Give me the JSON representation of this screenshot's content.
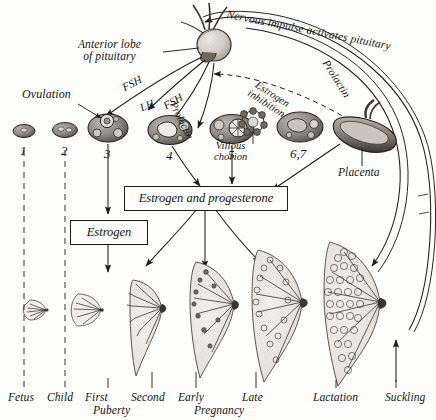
{
  "figure": {
    "background_color": "#fdfdfc",
    "ink_color": "#1b1b1b"
  },
  "organ_labels": {
    "pituitary": "Anterior lobe\nof pituitary",
    "pituitary_line1": "Anterior lobe",
    "pituitary_line2": "of pituitary",
    "ovulation": "Ovulation",
    "villous_chorion_line1": "Villous",
    "villous_chorion_line2": "chorion",
    "placenta": "Placenta"
  },
  "hormone_arrows": [
    {
      "label": "FSH"
    },
    {
      "label": "LH"
    },
    {
      "label": "FSH"
    },
    {
      "label": "Prolactin"
    }
  ],
  "arc_labels": {
    "nervous_impulse": "Nervous impulse activates pituitary",
    "prolactin": "Prolactin",
    "estrogen_inhibition_line1": "Estrogen",
    "estrogen_inhibition_line2": "inhibition"
  },
  "boxes": [
    {
      "id": "estrogen-progesterone",
      "label": "Estrogen and progesterone"
    },
    {
      "id": "estrogen",
      "label": "Estrogen"
    }
  ],
  "ovary_stages": [
    {
      "number": "1"
    },
    {
      "number": "2"
    },
    {
      "number": "3"
    },
    {
      "number": "4"
    },
    {
      "number": "5"
    },
    {
      "number": "6,7"
    }
  ],
  "stage_labels": [
    {
      "label": "Fetus"
    },
    {
      "label": "Child"
    },
    {
      "label": "First"
    },
    {
      "label": "Second"
    },
    {
      "label": "Puberty"
    },
    {
      "label": "Early"
    },
    {
      "label": "Late"
    },
    {
      "label": "Pregnancy"
    },
    {
      "label": "Lactation"
    },
    {
      "label": "Suckling"
    }
  ]
}
